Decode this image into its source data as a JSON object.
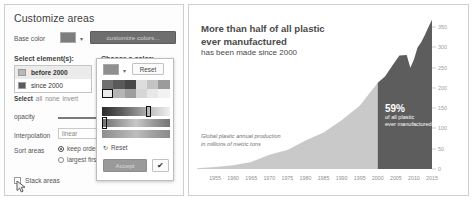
{
  "panel": {
    "title": "Customize areas",
    "base_color_label": "Base color",
    "base_color_hex": "#7d7d7d",
    "customize_colors_button": "customize colors...",
    "select_elements_label": "Select element(s):",
    "choose_color_label": "Choose a color:",
    "elements": [
      {
        "label": "before 2000",
        "color": "#b9b9b9",
        "selected": true
      },
      {
        "label": "since 2000",
        "color": "#5c5c5c",
        "selected": false
      }
    ],
    "select_actions": {
      "prefix": "Select",
      "options": [
        "all",
        "none",
        "invert"
      ]
    },
    "opacity_label": "opacity",
    "interpolation_label": "Interpolation",
    "interpolation_value": "linear",
    "sort_areas_label": "Sort areas",
    "sort_options": [
      {
        "label": "keep order",
        "selected": true
      },
      {
        "label": "largest first",
        "selected": false
      }
    ],
    "stack_areas_label": "Stack areas",
    "stack_areas_checked": false
  },
  "picker": {
    "current_color": "#8f8f8f",
    "reset_button": "Reset",
    "palette_reset": "Reset",
    "accept_button": "Accept",
    "confirm_icon": "✔",
    "caret_icon": "▾",
    "swatches": [
      [
        "#6f6f6f",
        "#595959",
        "#474747",
        "#dddddd",
        "#c4c4c4",
        "#9b9b9b"
      ],
      [
        "#ececec",
        "#b5b5b5",
        "#9e9e9e",
        "#d6d6d6",
        "#e8e8e8",
        "#f2f2f2"
      ]
    ],
    "marked_swatch": {
      "row": 1,
      "col": 0
    }
  },
  "chart_card": {
    "title_line1": "More than half of all plastic",
    "title_line2": "ever manufactured",
    "subtitle": "has been made since 2000",
    "note_line1": "Global plastic annual production",
    "note_line2": "in millions of metric tons",
    "annotation": {
      "value": "59%",
      "line1": "of all plastic",
      "line2": "ever manufactured"
    }
  },
  "chart_data": {
    "type": "area",
    "title": "More than half of all plastic ever manufactured has been made since 2000",
    "xlabel": "",
    "ylabel": "Global plastic annual production in millions of metric tons",
    "xlim": [
      1950,
      2015
    ],
    "ylim": [
      0,
      375
    ],
    "grid": false,
    "legend": "none",
    "yticks": [
      0,
      50,
      100,
      150,
      200,
      250,
      300,
      350
    ],
    "xticks": [
      1955,
      1960,
      1965,
      1970,
      1975,
      1980,
      1985,
      1990,
      1995,
      2000,
      2005,
      2010,
      2015
    ],
    "series": [
      {
        "name": "before 2000",
        "color": "#c9c9c9",
        "x": [
          1950,
          1955,
          1960,
          1965,
          1970,
          1975,
          1980,
          1985,
          1990,
          1995,
          2000
        ],
        "values": [
          2,
          5,
          9,
          17,
          35,
          47,
          70,
          90,
          120,
          156,
          213
        ]
      },
      {
        "name": "since 2000",
        "color": "#5d5d5d",
        "x": [
          2000,
          2002,
          2004,
          2006,
          2008,
          2009,
          2010,
          2011,
          2012,
          2013,
          2014,
          2015
        ],
        "values": [
          213,
          228,
          255,
          280,
          281,
          250,
          270,
          300,
          313,
          330,
          350,
          368
        ]
      }
    ]
  }
}
